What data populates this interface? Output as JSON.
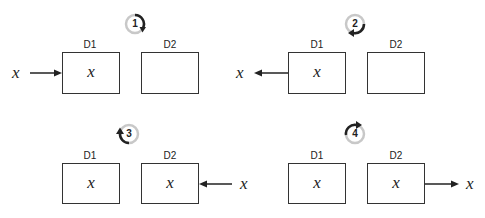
{
  "diagram": {
    "type": "two-deque/stack step diagram",
    "colors": {
      "stroke": "#333333",
      "badge_ring": "#c8c8c8",
      "badge_arrow": "#222222"
    },
    "panels": [
      {
        "step": "1",
        "rotation": "clockwise",
        "boxes": [
          {
            "label": "D1",
            "content": "x"
          },
          {
            "label": "D2",
            "content": ""
          }
        ],
        "arrow": {
          "direction": "into D1 from left",
          "var": "x"
        }
      },
      {
        "step": "2",
        "rotation": "clockwise-bottom",
        "boxes": [
          {
            "label": "D1",
            "content": "x"
          },
          {
            "label": "D2",
            "content": ""
          }
        ],
        "arrow": {
          "direction": "out of D1 to left",
          "var": "x"
        }
      },
      {
        "step": "3",
        "rotation": "counterclockwise",
        "boxes": [
          {
            "label": "D1",
            "content": "x"
          },
          {
            "label": "D2",
            "content": "x"
          }
        ],
        "arrow": {
          "direction": "into D2 from right",
          "var": "x"
        }
      },
      {
        "step": "4",
        "rotation": "counterclockwise-top",
        "boxes": [
          {
            "label": "D1",
            "content": "x"
          },
          {
            "label": "D2",
            "content": "x"
          }
        ],
        "arrow": {
          "direction": "out of D2 to right",
          "var": "x"
        }
      }
    ]
  }
}
